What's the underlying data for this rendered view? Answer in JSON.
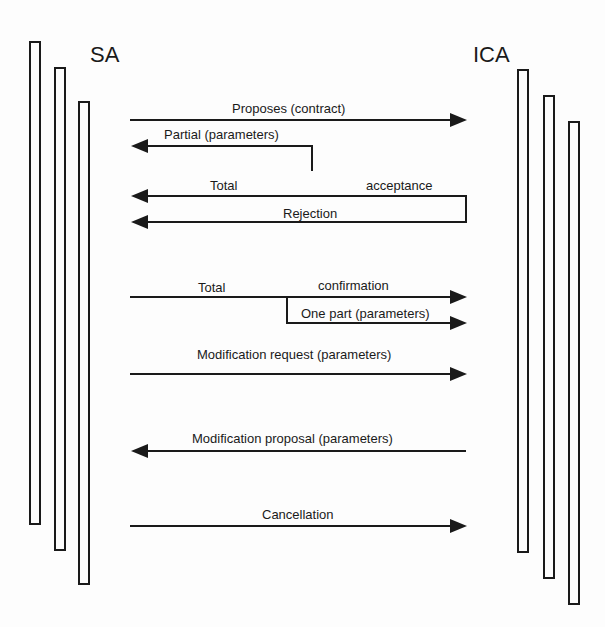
{
  "actors": {
    "left": {
      "label": "SA"
    },
    "right": {
      "label": "ICA"
    }
  },
  "messages": [
    {
      "id": "proposes",
      "label": "Proposes (contract)",
      "direction": "SA->ICA"
    },
    {
      "id": "partial",
      "label": "Partial (parameters)",
      "direction": "ICA->SA"
    },
    {
      "id": "total-acceptance-left",
      "label": "Total",
      "direction": "ICA->SA"
    },
    {
      "id": "total-acceptance-right",
      "label": "acceptance",
      "direction": "ICA->SA"
    },
    {
      "id": "rejection",
      "label": "Rejection",
      "direction": "ICA->SA"
    },
    {
      "id": "total-confirmation-left",
      "label": "Total",
      "direction": "SA->ICA"
    },
    {
      "id": "total-confirmation-right",
      "label": "confirmation",
      "direction": "SA->ICA"
    },
    {
      "id": "one-part",
      "label": "One part (parameters)",
      "direction": "SA->ICA"
    },
    {
      "id": "modification-request",
      "label": "Modification request (parameters)",
      "direction": "SA->ICA"
    },
    {
      "id": "modification-proposal",
      "label": "Modification proposal (parameters)",
      "direction": "ICA->SA"
    },
    {
      "id": "cancellation",
      "label": "Cancellation",
      "direction": "SA->ICA"
    }
  ],
  "colors": {
    "stroke": "#1a1a1a",
    "background": "#fdfdfd"
  }
}
